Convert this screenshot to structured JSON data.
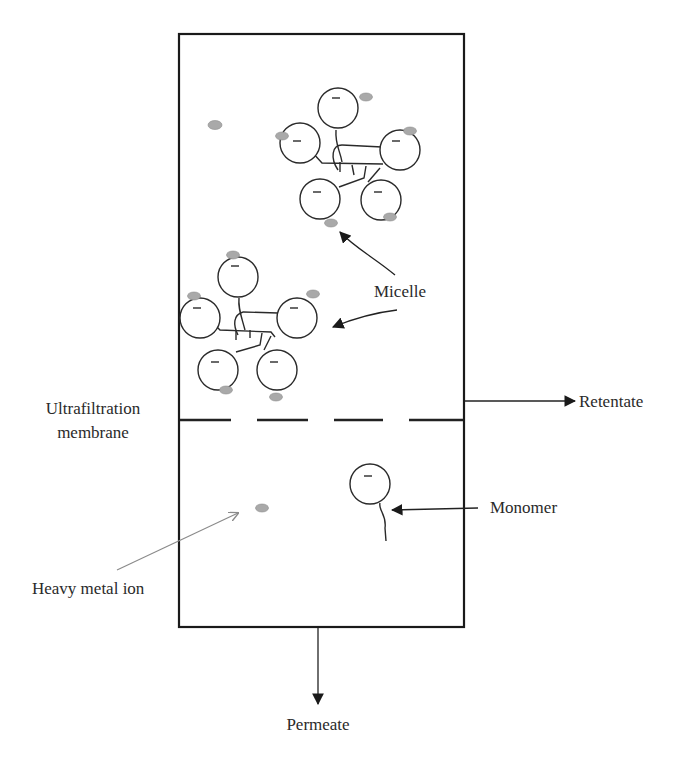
{
  "diagram": {
    "type": "micellar-enhanced ultrafiltration schematic",
    "labels": {
      "micelle": "Micelle",
      "membrane_line1": "Ultrafiltration",
      "membrane_line2": "membrane",
      "retentate": "Retentate",
      "monomer": "Monomer",
      "heavy_metal_ion": "Heavy metal ion",
      "permeate": "Permeate"
    },
    "symbols": {
      "surfactant_head_charge": "−"
    },
    "colors": {
      "line": "#1a1a1a",
      "ion_fill": "#a9a9a9",
      "pointer_grey": "#8a8a8a",
      "background": "#ffffff"
    },
    "components": [
      "separation-cell",
      "upper-micelle",
      "lower-micelle",
      "free-metal-ion",
      "ultrafiltration-membrane",
      "monomer",
      "permeate-ion"
    ]
  }
}
